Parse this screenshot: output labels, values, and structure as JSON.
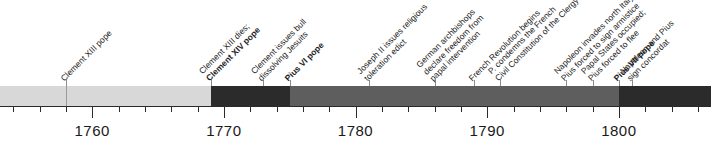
{
  "figure": {
    "name": "papacy-french-revolution-timeline",
    "axis": {
      "start_year": 1753,
      "end_year": 1807,
      "major_ticks": [
        {
          "year": 1760,
          "label": "1760"
        },
        {
          "year": 1770,
          "label": "1770"
        },
        {
          "year": 1780,
          "label": "1780"
        },
        {
          "year": 1790,
          "label": "1790"
        },
        {
          "year": 1800,
          "label": "1800"
        }
      ],
      "minor_tick_step": 2
    },
    "bar": {
      "segments": [
        {
          "name": "benedict-xiv",
          "start_year": 1753,
          "end_year": 1758,
          "color": "#d8d8d8"
        },
        {
          "name": "clement-xiii",
          "start_year": 1758,
          "end_year": 1769,
          "color": "#d8d8d8"
        },
        {
          "name": "clement-xiv",
          "start_year": 1769,
          "end_year": 1775,
          "color": "#2b2b2b"
        },
        {
          "name": "pius-vi",
          "start_year": 1775,
          "end_year": 1800,
          "color": "#5e5e5e"
        },
        {
          "name": "pius-vii",
          "start_year": 1800,
          "end_year": 1807,
          "color": "#2b2b2b"
        }
      ],
      "dividers": [
        {
          "name": "clement-xiii-start",
          "year": 1758,
          "color": "#9a9a9a"
        }
      ]
    },
    "events": [
      {
        "id": "clement-xiii-pope",
        "year": 1758,
        "lines": [
          {
            "text": "Clement XIII pope",
            "bold": false
          }
        ],
        "leader": true
      },
      {
        "id": "clement-xiv-pope",
        "year": 1769,
        "lines": [
          {
            "text": "Clement XIII dies;",
            "bold": false
          },
          {
            "text": "Clement XIV pope",
            "bold": true
          }
        ],
        "leader": true
      },
      {
        "id": "bull-dissolving-jesuits",
        "year": 1773,
        "lines": [
          {
            "text": "Clement issues bull",
            "bold": false
          },
          {
            "text": "dissolving Jesuits",
            "bold": false
          }
        ],
        "leader": true
      },
      {
        "id": "pius-vi-pope",
        "year": 1775,
        "lines": [
          {
            "text": "Pius VI pope",
            "bold": true
          }
        ],
        "leader": true
      },
      {
        "id": "joseph-ii-toleration-edict",
        "year": 1781,
        "lines": [
          {
            "text": "Joseph II issues religious",
            "bold": false
          },
          {
            "text": "toleration edict",
            "bold": false
          }
        ],
        "leader": true
      },
      {
        "id": "german-archbishops-freedom",
        "year": 1786,
        "lines": [
          {
            "text": "German archbishops",
            "bold": false
          },
          {
            "text": "declare freedom from",
            "bold": false
          },
          {
            "text": "papal intervention",
            "bold": false
          }
        ],
        "leader": true
      },
      {
        "id": "french-revolution-begins",
        "year": 1789,
        "lines": [
          {
            "text": "French Revolution begins",
            "bold": false
          }
        ],
        "leader": true
      },
      {
        "id": "condemns-civil-constitution",
        "year": 1791,
        "lines": [
          {
            "text": "P. condemns the French",
            "bold": false
          },
          {
            "text": "Civil Constitution of the Clergy",
            "bold": false
          }
        ],
        "leader": true
      },
      {
        "id": "napoleon-invades-north-italy",
        "year": 1796,
        "lines": [
          {
            "text": "Napoleon invades north Italy;",
            "bold": false
          },
          {
            "text": "Pius forced to sign armistice",
            "bold": false
          }
        ],
        "leader": true
      },
      {
        "id": "papal-states-occupied",
        "year": 1798,
        "lines": [
          {
            "text": "Papal States occupied;",
            "bold": false
          },
          {
            "text": "Pius forced to flee",
            "bold": false
          }
        ],
        "leader": true
      },
      {
        "id": "pius-vii-pope",
        "year": 1800,
        "lines": [
          {
            "text": "Pius VII pope",
            "bold": true
          }
        ],
        "leader": true
      },
      {
        "id": "napoleon-pius-concordat",
        "year": 1801,
        "lines": [
          {
            "text": "Napoleon and Pius",
            "bold": false
          },
          {
            "text": "sign concordat",
            "bold": false
          }
        ],
        "leader": true
      }
    ]
  }
}
